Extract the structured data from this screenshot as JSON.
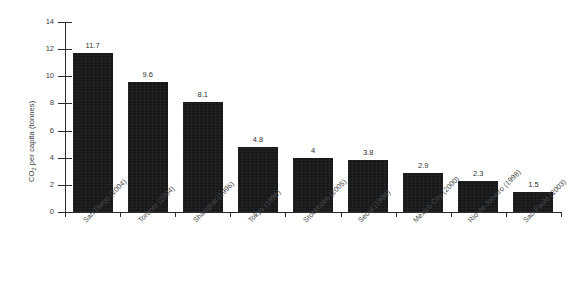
{
  "chart_data": {
    "type": "bar",
    "title": "",
    "subtitle": "",
    "xlabel": "",
    "ylabel_text": "per capita (tonnes)",
    "ylabel_prefix": "CO",
    "ylabel_subscript": "2",
    "ylim": [
      0,
      14
    ],
    "ytick_values": [
      0,
      2,
      4,
      6,
      8,
      10,
      12,
      14
    ],
    "ytick_labels": [
      "0",
      "2",
      "4",
      "6",
      "8",
      "10",
      "12",
      "14"
    ],
    "grid": false,
    "legend": null,
    "bar_color": "#17181a",
    "axis_color": "#2b2b2b",
    "text_color": "#3a3a3a",
    "categories": [
      "San Diego (2004)",
      "Toronto (2004)",
      "Shanghai (1996)",
      "Tokyo (1998)",
      "Stockholm (2005)",
      "Seoul (1998)",
      "Mexico City (2000)",
      "Rio de Janeiro (1998)",
      "Sao Paulo (2003)"
    ],
    "values": [
      11.7,
      9.6,
      8.1,
      4.8,
      4,
      3.8,
      2.9,
      2.3,
      1.5
    ],
    "value_labels": [
      "11.7",
      "9.6",
      "8.1",
      "4.8",
      "4",
      "3.8",
      "2.9",
      "2.3",
      "1.5"
    ]
  }
}
